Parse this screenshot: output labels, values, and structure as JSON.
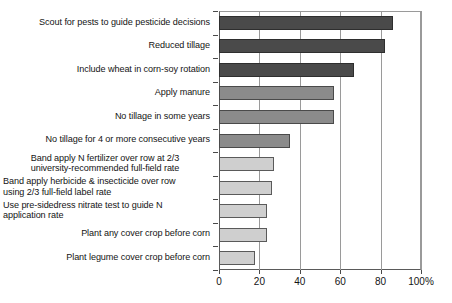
{
  "chart_data": {
    "type": "bar",
    "orientation": "horizontal",
    "title": "",
    "subtitle": "",
    "xlabel": "",
    "ylabel": "",
    "xlim": [
      0,
      100
    ],
    "grid": true,
    "legend": "none",
    "axis_suffix": "%",
    "xticks": [
      "0",
      "20",
      "40",
      "60",
      "80",
      "100%"
    ],
    "xtick_values": [
      0,
      20,
      40,
      60,
      80,
      100
    ],
    "categories": [
      "Scout for pests to guide pesticide decisions",
      "Reduced tillage",
      "Include wheat in corn-soy rotation",
      "Apply manure",
      "No tillage in some years",
      "No tillage for 4 or more consecutive years",
      "Band apply N fertilizer over row at 2/3 university-recommended full-field rate",
      "Band apply herbicide & insecticide over row using 2/3 full-field label rate",
      "Use pre-sidedress nitrate test to guide N application rate",
      "Plant any cover crop before corn",
      "Plant legume cover crop before corn"
    ],
    "values": [
      86,
      82,
      67,
      57,
      57,
      35,
      27,
      26,
      24,
      24,
      18
    ],
    "bar_shades": [
      "dark",
      "dark",
      "dark",
      "mid",
      "mid",
      "mid",
      "light",
      "light",
      "light",
      "light",
      "light"
    ],
    "colors": {
      "dark": "#4a4a4a",
      "mid": "#8b8b8b",
      "light": "#cfcfcf",
      "axis": "#4a4a4a",
      "grid": "#9a9a9a",
      "text": "#141414",
      "background": "#ffffff"
    }
  },
  "labels": [
    {
      "line1": "Scout for pests to guide pesticide decisions",
      "line2": "",
      "align": "align-right"
    },
    {
      "line1": "Reduced tillage",
      "line2": "",
      "align": "align-right"
    },
    {
      "line1": "Include wheat in corn-soy rotation",
      "line2": "",
      "align": "align-right"
    },
    {
      "line1": "Apply manure",
      "line2": "",
      "align": "align-right"
    },
    {
      "line1": "No tillage in some years",
      "line2": "",
      "align": "align-right"
    },
    {
      "line1": "No tillage for 4 or more consecutive years",
      "line2": "",
      "align": "align-right"
    },
    {
      "line1": "Band apply N fertilizer over row at 2/3",
      "line2": "university-recommended full-field rate",
      "align": "align-center"
    },
    {
      "line1": "Band apply herbicide & insecticide over row",
      "line2": "using 2/3 full-field label rate",
      "align": "align-left"
    },
    {
      "line1": "Use  pre-sidedress nitrate test to guide N",
      "line2": "application rate",
      "align": "align-left"
    },
    {
      "line1": "Plant any cover crop before corn",
      "line2": "",
      "align": "align-right"
    },
    {
      "line1": "Plant legume cover crop before corn",
      "line2": "",
      "align": "align-right"
    }
  ]
}
